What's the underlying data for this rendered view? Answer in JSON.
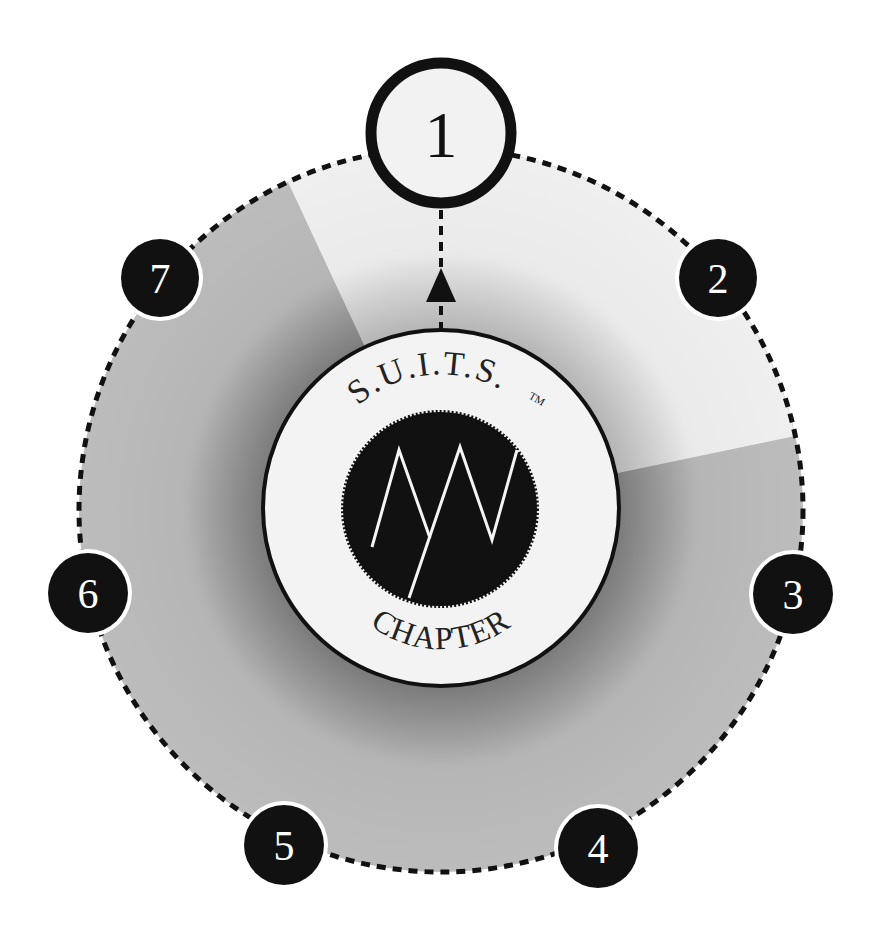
{
  "diagram": {
    "title_top": "S.U.I.T.S.",
    "trademark": "TM",
    "title_bottom": "CHAPTER",
    "steps": [
      {
        "label": "1",
        "active": true
      },
      {
        "label": "2",
        "active": false
      },
      {
        "label": "3",
        "active": false
      },
      {
        "label": "4",
        "active": false
      },
      {
        "label": "5",
        "active": false
      },
      {
        "label": "6",
        "active": false
      },
      {
        "label": "7",
        "active": false
      }
    ],
    "colors": {
      "background": "#ffffff",
      "ring_fill": "#b9b9b9",
      "active_sector_fill": "#ececec",
      "inner_circle_fill": "#f3f3f3",
      "badge_fill": "#111111",
      "badge_text": "#ffffff",
      "active_badge_fill": "#f2f2f2",
      "stroke": "#111111"
    }
  }
}
